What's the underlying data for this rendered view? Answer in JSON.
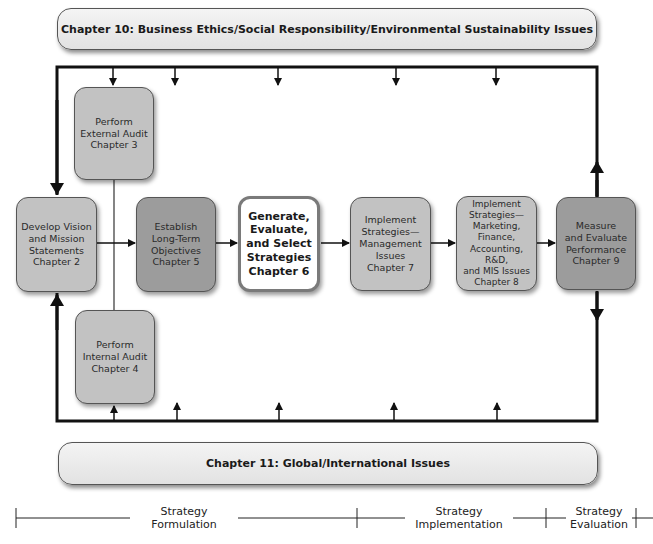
{
  "banners": {
    "top": "Chapter 10: Business Ethics/Social Responsibility/Environmental Sustainability Issues",
    "bottom": "Chapter 11:  Global/International Issues"
  },
  "boxes": {
    "ch2": "Develop Vision\nand Mission\nStatements\nChapter 2",
    "ch3": "Perform\nExternal Audit\nChapter 3",
    "ch4": "Perform\nInternal Audit\nChapter 4",
    "ch5": "Establish\nLong-Term\nObjectives\nChapter 5",
    "ch6": "Generate,\nEvaluate,\nand Select\nStrategies\nChapter 6",
    "ch7": "Implement\nStrategies—\nManagement\nIssues\nChapter 7",
    "ch8": "Implement\nStrategies—\nMarketing,\nFinance,\nAccounting, R&D,\nand MIS Issues\nChapter 8",
    "ch9": "Measure\nand Evaluate\nPerformance\nChapter 9"
  },
  "phases": {
    "formulation": "Strategy\nFormulation",
    "implementation": "Strategy\nImplementation",
    "evaluation": "Strategy\nEvaluation"
  },
  "colors": {
    "box_light": "#c2c2c2",
    "box_dark": "#9c9c9c",
    "highlight_box": "#ffffff",
    "line": "#111111"
  }
}
